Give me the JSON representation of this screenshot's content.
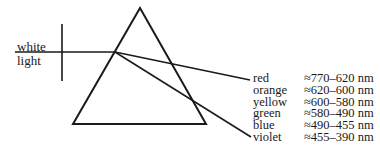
{
  "diagram": {
    "input_label": {
      "line1": "white",
      "line2": "light"
    },
    "spectrum": [
      {
        "color": "red",
        "range": "≈770–620 nm"
      },
      {
        "color": "orange",
        "range": "≈620–600 nm"
      },
      {
        "color": "yellow",
        "range": "≈600–580 nm"
      },
      {
        "color": "green",
        "range": "≈580–490 nm"
      },
      {
        "color": "blue",
        "range": "≈490–455 nm"
      },
      {
        "color": "violet",
        "range": "≈455–390 nm"
      }
    ],
    "line_color": "#1a1a1a"
  }
}
